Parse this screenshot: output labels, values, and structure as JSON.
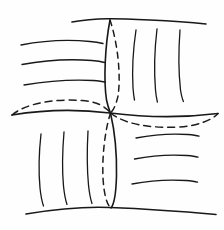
{
  "figure": {
    "kind": "line-drawing",
    "background_color": "#fefefe",
    "ink_color": "#181818",
    "hidden_ink_color": "#1d1d1d",
    "canvas": {
      "width": 224,
      "height": 230
    }
  },
  "strokes": {
    "boundary_top": {
      "label": "top-boundary-edge",
      "style": "solid",
      "width": 1.6,
      "d": "M 72 22 C 96 17.5 118 18.5 150 20 C 172 21 192 22.5 206 24"
    },
    "boundary_bottom": {
      "label": "bottom-boundary-edge",
      "style": "solid",
      "width": 1.6,
      "d": "M 26 214 C 56 209 86 206.5 110 207.5 C 150 209 188 212 216 214.5"
    },
    "center_horizontal": {
      "label": "center-horizontal-edge",
      "style": "solid",
      "width": 1.6,
      "d": "M 12 115 C 42 110 78 109 110 113 C 150 118 190 117 218 113.5"
    },
    "center_vertical_upper": {
      "label": "center-vertical-edge-upper",
      "style": "solid",
      "width": 1.6,
      "d": "M 110 20 C 105 46 103.5 80 106.5 100 C 108 107 109.5 110.5 110.5 113"
    },
    "center_vertical_lower": {
      "label": "center-vertical-edge-lower",
      "style": "solid",
      "width": 1.6,
      "d": "M 110.5 113 C 114 128 117 152 116.5 176 C 116 194 113.5 205 111 208"
    },
    "hidden_ellipse_left": {
      "label": "hidden-arc-left",
      "style": "dashed",
      "width": 1.5,
      "dash": "7 5",
      "d": "M 12 115 C 26 103 56 98.5 82 100.5 C 96 101.5 105 106 110.5 113"
    },
    "hidden_ellipse_right": {
      "label": "hidden-arc-right",
      "style": "dashed",
      "width": 1.5,
      "dash": "7 5",
      "d": "M 110.5 113 C 124 124 150 128.5 178 127 C 198 126 212 120 218 113.5"
    },
    "hidden_vertical_upper": {
      "label": "hidden-vertical-arc-upper",
      "style": "dashed",
      "width": 1.5,
      "dash": "6 5",
      "d": "M 110 20 C 118 44 121 76 118 96 C 115.5 107 112.5 111 110.5 113"
    },
    "hidden_vertical_lower": {
      "label": "hidden-vertical-arc-lower",
      "style": "dashed",
      "width": 1.5,
      "dash": "6 5",
      "d": "M 110.5 113 C 105 130 102 156 103 178 C 104 195 107 205 111 208"
    }
  },
  "rulings": {
    "top_left": {
      "label": "ruling-lines-top-left",
      "orientation": "horizontal",
      "count": 3,
      "style": "solid",
      "width": 1.3,
      "paths": [
        "M 21 45 C 44 40.5 70 39.5 90 41.5 C 96 42 100 42.8 103 43.5",
        "M 22 64.5 C 46 60 72 59 92 60.5 C 98 61 102 61.8 104.5 62.5",
        "M 24 85 C 48 81 74 79.5 93 80.5 C 99 81 103 81.6 105.5 82.2"
      ]
    },
    "top_right": {
      "label": "ruling-lines-top-right",
      "orientation": "vertical",
      "count": 3,
      "style": "solid",
      "width": 1.3,
      "paths": [
        "M 136 30 C 133 50 132 70 133 88 C 133.5 94 134 97.5 134.5 100",
        "M 157 29 C 154.5 50 154 72 155.5 90 C 156 96 156.8 99.5 157.4 102",
        "M 180 30 C 178.5 50 178.5 72 180.5 90 C 181.5 96 182.5 99.5 183.4 101.5"
      ]
    },
    "bottom_left": {
      "label": "ruling-lines-bottom-left",
      "orientation": "vertical",
      "count": 3,
      "style": "solid",
      "width": 1.3,
      "paths": [
        "M 41 134 C 39 152 38.5 172 40 188 C 41 198 42.5 203 43.5 206",
        "M 64 132 C 62.5 150 62 170 63.5 186 C 64.5 196 66 201.5 67 204.5",
        "M 88 131 C 87 149 87 169 88.5 185 C 89.5 195 91 200.5 92 203.5"
      ]
    },
    "bottom_right": {
      "label": "ruling-lines-bottom-right",
      "orientation": "horizontal",
      "count": 3,
      "style": "solid",
      "width": 1.3,
      "paths": [
        "M 136 138 C 154 134.5 174 133.5 188 134.5 C 194 135 197 135.6 199 136.2",
        "M 134.5 159 C 152 155.5 172 154.5 187 155.5 C 193 156 196 156.6 198 157.2",
        "M 132 184 C 150 180.5 170 179.5 186 180.5 C 192 181 195.5 181.6 197.5 182.2"
      ]
    }
  }
}
